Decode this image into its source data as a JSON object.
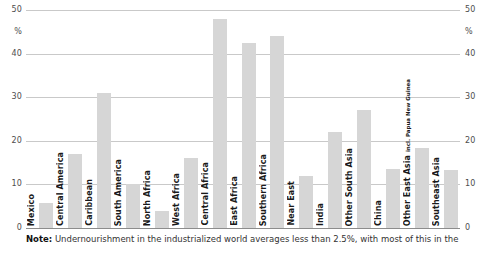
{
  "chart_data": {
    "type": "bar",
    "title": "",
    "xlabel": "",
    "ylabel": "%",
    "ylim": [
      0,
      50
    ],
    "yticks": [
      0,
      10,
      20,
      30,
      40,
      50
    ],
    "grid": true,
    "legend": "none",
    "axis_unit_label": "%",
    "left_axis_labels": [
      "50",
      "%",
      "40",
      "30",
      "20",
      "10",
      "0"
    ],
    "right_axis_labels": [
      "50",
      "%",
      "40",
      "30",
      "20",
      "10",
      "0"
    ],
    "categories": [
      "Mexico",
      "Central America",
      "Caribbean",
      "South America",
      "North Africa",
      "West Africa",
      "Central Africa",
      "East Africa",
      "Southern Africa",
      "Near East",
      "India",
      "Other South Asia",
      "China",
      "Other East Asia",
      "Southeast Asia"
    ],
    "values": [
      5.7,
      17,
      31,
      10,
      4,
      16,
      48,
      42.5,
      44,
      12,
      22,
      27,
      13.5,
      18.3,
      13.3
    ],
    "bars": [
      {
        "label": "Mexico",
        "sublabel": "",
        "value": 5.7
      },
      {
        "label": "Central America",
        "sublabel": "",
        "value": 17
      },
      {
        "label": "Caribbean",
        "sublabel": "",
        "value": 31
      },
      {
        "label": "South America",
        "sublabel": "",
        "value": 10
      },
      {
        "label": "North Africa",
        "sublabel": "",
        "value": 4
      },
      {
        "label": "West Africa",
        "sublabel": "",
        "value": 16
      },
      {
        "label": "Central Africa",
        "sublabel": "",
        "value": 48
      },
      {
        "label": "East Africa",
        "sublabel": "",
        "value": 42.5
      },
      {
        "label": "Southern Africa",
        "sublabel": "",
        "value": 44
      },
      {
        "label": "Near East",
        "sublabel": "",
        "value": 12
      },
      {
        "label": "India",
        "sublabel": "",
        "value": 22
      },
      {
        "label": "Other South Asia",
        "sublabel": "",
        "value": 27
      },
      {
        "label": "China",
        "sublabel": "",
        "value": 13.5
      },
      {
        "label": "Other East Asia ",
        "sublabel": "incl. Papua New Guinea",
        "value": 18.3
      },
      {
        "label": "Southeast Asia",
        "sublabel": "",
        "value": 13.3
      }
    ],
    "bar_color": "#d6d6d6",
    "gridline_color": "#c9c9c9",
    "baseline_color": "#8c8c8c"
  },
  "note": {
    "lead": "Note:",
    "text": " Undernourishment in the industrialized world averages less than 2.5%, with most of this in the"
  }
}
